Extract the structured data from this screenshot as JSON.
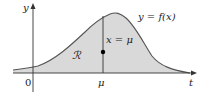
{
  "diagram": {
    "type": "function-graph",
    "axes": {
      "x_label": "t",
      "y_label": "y",
      "origin_label": "0",
      "x_tick_label": "μ"
    },
    "curve_label": "y = f(x)",
    "vertical_line_label": "x = μ",
    "region_label": "ℛ",
    "colors": {
      "region_fill": "#d9d9d9",
      "curve": "#555555",
      "axis": "#333333",
      "point": "#000000",
      "text": "#222222"
    }
  }
}
